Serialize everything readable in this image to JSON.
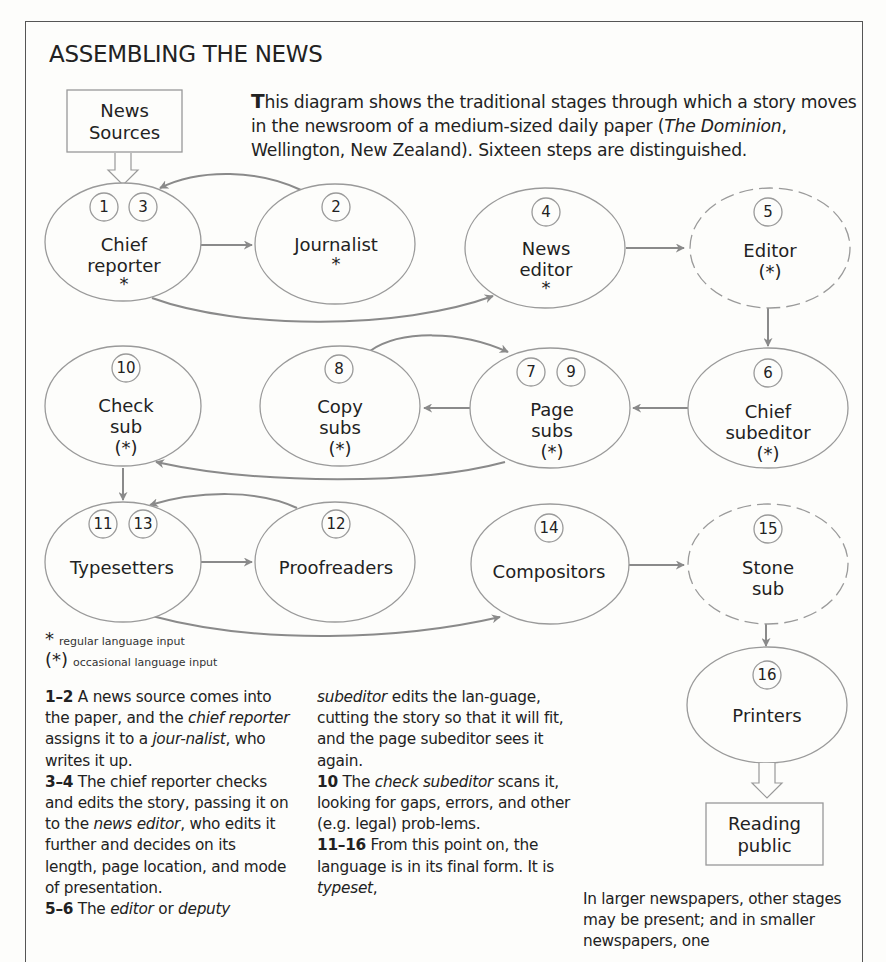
{
  "title": "ASSEMBLING THE NEWS",
  "intro": {
    "dropcap": "T",
    "text_before_italic": "his diagram shows the traditional stages through which a story moves in the newsroom of a medium-sized daily paper (",
    "italic": "The Dominion",
    "text_after_italic": ", Wellington, New Zealand). Sixteen steps are distinguished."
  },
  "sources_box": {
    "line1": "News",
    "line2": "Sources"
  },
  "output_box": {
    "line1": "Reading",
    "line2": "public"
  },
  "nodes": [
    {
      "id": "chief-reporter",
      "steps": [
        "1",
        "3"
      ],
      "lines": [
        "Chief",
        "reporter",
        "*"
      ],
      "dashed": false
    },
    {
      "id": "journalist",
      "steps": [
        "2"
      ],
      "lines": [
        "Journalist",
        "*"
      ],
      "dashed": false
    },
    {
      "id": "news-editor",
      "steps": [
        "4"
      ],
      "lines": [
        "News",
        "editor",
        "*"
      ],
      "dashed": false
    },
    {
      "id": "editor",
      "steps": [
        "5"
      ],
      "lines": [
        "Editor",
        "(*)"
      ],
      "dashed": true
    },
    {
      "id": "chief-subeditor",
      "steps": [
        "6"
      ],
      "lines": [
        "Chief",
        "subeditor",
        "(*)"
      ],
      "dashed": false
    },
    {
      "id": "page-subs",
      "steps": [
        "7",
        "9"
      ],
      "lines": [
        "Page",
        "subs",
        "(*)"
      ],
      "dashed": false
    },
    {
      "id": "copy-subs",
      "steps": [
        "8"
      ],
      "lines": [
        "Copy",
        "subs",
        "(*)"
      ],
      "dashed": false
    },
    {
      "id": "check-sub",
      "steps": [
        "10"
      ],
      "lines": [
        "Check",
        "sub",
        "(*)"
      ],
      "dashed": false
    },
    {
      "id": "typesetters",
      "steps": [
        "11",
        "13"
      ],
      "lines": [
        "Typesetters"
      ],
      "dashed": false
    },
    {
      "id": "proofreaders",
      "steps": [
        "12"
      ],
      "lines": [
        "Proofreaders"
      ],
      "dashed": false
    },
    {
      "id": "compositors",
      "steps": [
        "14"
      ],
      "lines": [
        "Compositors"
      ],
      "dashed": false
    },
    {
      "id": "stone-sub",
      "steps": [
        "15"
      ],
      "lines": [
        "Stone",
        "sub"
      ],
      "dashed": true
    },
    {
      "id": "printers",
      "steps": [
        "16"
      ],
      "lines": [
        "Printers"
      ],
      "dashed": false
    }
  ],
  "edges": [
    [
      "news-sources",
      "chief-reporter"
    ],
    [
      "chief-reporter",
      "journalist"
    ],
    [
      "journalist",
      "chief-reporter"
    ],
    [
      "chief-reporter",
      "news-editor"
    ],
    [
      "news-editor",
      "editor"
    ],
    [
      "editor",
      "chief-subeditor"
    ],
    [
      "chief-subeditor",
      "page-subs"
    ],
    [
      "page-subs",
      "copy-subs"
    ],
    [
      "copy-subs",
      "page-subs"
    ],
    [
      "page-subs",
      "check-sub"
    ],
    [
      "check-sub",
      "typesetters"
    ],
    [
      "typesetters",
      "proofreaders"
    ],
    [
      "proofreaders",
      "typesetters"
    ],
    [
      "typesetters",
      "compositors"
    ],
    [
      "compositors",
      "stone-sub"
    ],
    [
      "stone-sub",
      "printers"
    ],
    [
      "printers",
      "reading-public"
    ]
  ],
  "legend": {
    "regular": {
      "symbol": "*",
      "label": "regular language input"
    },
    "occasional": {
      "symbol": "(*)",
      "label": "occasional language input"
    }
  },
  "columns": {
    "col1": [
      {
        "bold": "1–2",
        "parts": [
          " A news source comes into the paper, and the ",
          {
            "i": "chief reporter"
          },
          " assigns it to a ",
          {
            "i": "jour-nalist"
          },
          ", who writes it up."
        ]
      },
      {
        "bold": "3–4",
        "parts": [
          " The chief reporter checks and edits the story, passing it on to the ",
          {
            "i": "news editor"
          },
          ", who edits it further and decides on its length, page location, and mode of presentation."
        ]
      },
      {
        "bold": "5–6",
        "parts": [
          " The ",
          {
            "i": "editor"
          },
          " or ",
          {
            "i": "deputy"
          }
        ]
      }
    ],
    "col2": [
      {
        "bold": "",
        "parts": [
          {
            "i": "subeditor"
          },
          " edits the lan-guage, cutting the story so that it will fit, and the page subeditor sees it again."
        ]
      },
      {
        "bold": "10",
        "parts": [
          " The ",
          {
            "i": "check subeditor"
          },
          " scans it, looking for gaps, errors, and other (e.g. legal) prob-lems."
        ]
      },
      {
        "bold": "11–16",
        "parts": [
          " From this point on, the language is in its final form. It is ",
          {
            "i": "typeset"
          },
          ","
        ]
      }
    ],
    "col3": [
      {
        "bold": "",
        "parts": [
          "In larger newspapers, other stages may be present; and in smaller newspapers, one"
        ]
      }
    ]
  },
  "colors": {
    "stroke": "#8a8a8a",
    "arrow": "#8a8a8a",
    "text": "#222222",
    "frame": "#555555",
    "background": "#fdfdfb"
  }
}
